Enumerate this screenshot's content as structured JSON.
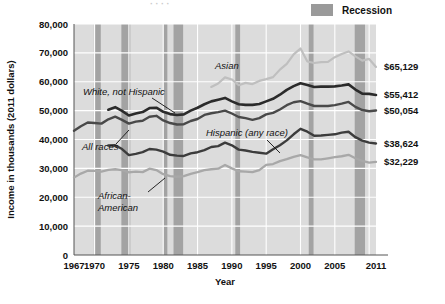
{
  "legend": {
    "label": "Recession",
    "swatch_color": "#a3a3a3"
  },
  "axes": {
    "y_title": "Income in thousands (2011 dollars)",
    "x_title": "Year",
    "y_ticks": [
      "0",
      "10,000",
      "20,000",
      "30,000",
      "40,000",
      "50,000",
      "60,000",
      "70,000",
      "80,000"
    ],
    "x_ticks": [
      "1967",
      "1970",
      "1975",
      "1980",
      "1985",
      "1990",
      "1995",
      "2000",
      "2005",
      "2011"
    ]
  },
  "series_labels": {
    "asian": "Asian",
    "white": "White, not Hispanic",
    "all_races": "All races",
    "hispanic": "Hispanic (any race)",
    "african_american_line1": "African-",
    "african_american_line2": "American"
  },
  "end_labels": {
    "asian": "$65,129",
    "white": "$55,412",
    "all_races": "$50,054",
    "hispanic": "$38,624",
    "african_american": "$32,229"
  },
  "chart_data": {
    "type": "line",
    "title": "",
    "xlabel": "Year",
    "ylabel": "Income in thousands (2011 dollars)",
    "xlim": [
      1967,
      2011
    ],
    "ylim": [
      0,
      80000
    ],
    "grid": true,
    "legend_position": "top-right",
    "x_tick_labels": [
      "1967",
      "1970",
      "1975",
      "1980",
      "1985",
      "1990",
      "1995",
      "2000",
      "2005",
      "2011"
    ],
    "y_tick_values": [
      0,
      10000,
      20000,
      30000,
      40000,
      50000,
      60000,
      70000,
      80000
    ],
    "recession_bands": [
      {
        "start": 1969.9,
        "end": 1970.9
      },
      {
        "start": 1973.9,
        "end": 1975.2
      },
      {
        "start": 1980.0,
        "end": 1980.6
      },
      {
        "start": 1981.5,
        "end": 1982.9
      },
      {
        "start": 1990.5,
        "end": 1991.2
      },
      {
        "start": 2001.2,
        "end": 2001.9
      },
      {
        "start": 2007.9,
        "end": 2009.4
      }
    ],
    "series": [
      {
        "name": "Asian",
        "color": "#bfbfbf",
        "width": 2.2,
        "end_value": 65129,
        "x": [
          1987,
          1988,
          1989,
          1990,
          1991,
          1992,
          1993,
          1994,
          1995,
          1996,
          1997,
          1998,
          1999,
          2000,
          2001,
          2002,
          2003,
          2004,
          2005,
          2006,
          2007,
          2008,
          2009,
          2010,
          2011
        ],
        "y": [
          58200,
          59400,
          61500,
          60800,
          58800,
          59600,
          59200,
          60300,
          60900,
          61600,
          64200,
          66200,
          69500,
          71500,
          67000,
          66500,
          66800,
          66900,
          68500,
          69600,
          70500,
          68800,
          67300,
          67900,
          65129
        ]
      },
      {
        "name": "White, not Hispanic",
        "color": "#2b2b2b",
        "width": 2.6,
        "end_value": 55412,
        "x": [
          1972,
          1973,
          1974,
          1975,
          1976,
          1977,
          1978,
          1979,
          1980,
          1981,
          1982,
          1983,
          1984,
          1985,
          1986,
          1987,
          1988,
          1989,
          1990,
          1991,
          1992,
          1993,
          1994,
          1995,
          1996,
          1997,
          1998,
          1999,
          2000,
          2001,
          2002,
          2003,
          2004,
          2005,
          2006,
          2007,
          2008,
          2009,
          2010,
          2011
        ],
        "y": [
          50300,
          51200,
          49900,
          48300,
          49000,
          49500,
          50900,
          51000,
          49600,
          48800,
          48500,
          48700,
          50000,
          51000,
          52200,
          53200,
          53800,
          54400,
          53200,
          52200,
          52000,
          52000,
          52300,
          53200,
          54100,
          55500,
          57200,
          58500,
          59500,
          58900,
          58200,
          58300,
          58300,
          58400,
          58700,
          59100,
          57300,
          55900,
          55800,
          55412
        ]
      },
      {
        "name": "All races",
        "color": "#494949",
        "width": 2.4,
        "end_value": 50054,
        "x": [
          1967,
          1968,
          1969,
          1970,
          1971,
          1972,
          1973,
          1974,
          1975,
          1976,
          1977,
          1978,
          1979,
          1980,
          1981,
          1982,
          1983,
          1984,
          1985,
          1986,
          1987,
          1988,
          1989,
          1990,
          1991,
          1992,
          1993,
          1994,
          1995,
          1996,
          1997,
          1998,
          1999,
          2000,
          2001,
          2002,
          2003,
          2004,
          2005,
          2006,
          2007,
          2008,
          2009,
          2010,
          2011
        ],
        "y": [
          43000,
          44600,
          45900,
          45700,
          45500,
          47000,
          47900,
          46800,
          45500,
          46200,
          46500,
          47900,
          48200,
          46600,
          45700,
          45200,
          45300,
          46400,
          47100,
          48500,
          49100,
          49500,
          50000,
          49000,
          47800,
          47400,
          46800,
          47400,
          48700,
          49200,
          50400,
          51900,
          52900,
          53300,
          52400,
          51600,
          51600,
          51600,
          51900,
          52400,
          53000,
          51300,
          50200,
          49800,
          50054
        ]
      },
      {
        "name": "Hispanic (any race)",
        "color": "#3c3c3c",
        "width": 2.4,
        "end_value": 38624,
        "x": [
          1972,
          1973,
          1974,
          1975,
          1976,
          1977,
          1978,
          1979,
          1980,
          1981,
          1982,
          1983,
          1984,
          1985,
          1986,
          1987,
          1988,
          1989,
          1990,
          1991,
          1992,
          1993,
          1994,
          1995,
          1996,
          1997,
          1998,
          1999,
          2000,
          2001,
          2002,
          2003,
          2004,
          2005,
          2006,
          2007,
          2008,
          2009,
          2010,
          2011
        ],
        "y": [
          37900,
          38000,
          36700,
          34600,
          35000,
          35600,
          36700,
          36500,
          35800,
          34700,
          34400,
          34300,
          35200,
          35600,
          36300,
          37400,
          37700,
          38900,
          38000,
          36500,
          36200,
          35700,
          35400,
          35100,
          36600,
          38000,
          39700,
          41800,
          43700,
          42700,
          41300,
          41400,
          41600,
          41800,
          42400,
          42700,
          40800,
          39600,
          38900,
          38624
        ]
      },
      {
        "name": "African-American",
        "color": "#a8a8a8",
        "width": 2.3,
        "end_value": 32229,
        "x": [
          1967,
          1968,
          1969,
          1970,
          1971,
          1972,
          1973,
          1974,
          1975,
          1976,
          1977,
          1978,
          1979,
          1980,
          1981,
          1982,
          1983,
          1984,
          1985,
          1986,
          1987,
          1988,
          1989,
          1990,
          1991,
          1992,
          1993,
          1994,
          1995,
          1996,
          1997,
          1998,
          1999,
          2000,
          2001,
          2002,
          2003,
          2004,
          2005,
          2006,
          2007,
          2008,
          2009,
          2010,
          2011
        ],
        "y": [
          26800,
          28200,
          29200,
          29100,
          28900,
          29500,
          29700,
          29400,
          28600,
          28900,
          28700,
          29900,
          29400,
          28000,
          27300,
          27100,
          27300,
          28100,
          28700,
          29400,
          29700,
          29900,
          31200,
          30000,
          29000,
          28900,
          28700,
          29400,
          31200,
          31500,
          32500,
          33200,
          34000,
          34600,
          33800,
          33100,
          33100,
          33500,
          33900,
          34200,
          34700,
          33500,
          32600,
          32000,
          32229
        ]
      }
    ]
  }
}
